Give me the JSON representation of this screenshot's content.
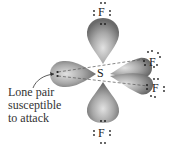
{
  "diagram": {
    "molecule": "SF4",
    "central_atom": "S",
    "ligands": [
      {
        "symbol": "F",
        "position": "axial-top"
      },
      {
        "symbol": "F",
        "position": "equatorial-upper-right"
      },
      {
        "symbol": "F",
        "position": "equatorial-lower-right"
      },
      {
        "symbol": "F",
        "position": "axial-bottom"
      }
    ],
    "lone_pair_position": "equatorial-left",
    "annotation": {
      "lines": [
        "Lone pair",
        "susceptible",
        "to attack"
      ]
    },
    "colors": {
      "lobe_dark": "#6e6e6e",
      "lobe_light": "#d8d8d8",
      "text": "#333333",
      "dots": "#222222"
    }
  }
}
